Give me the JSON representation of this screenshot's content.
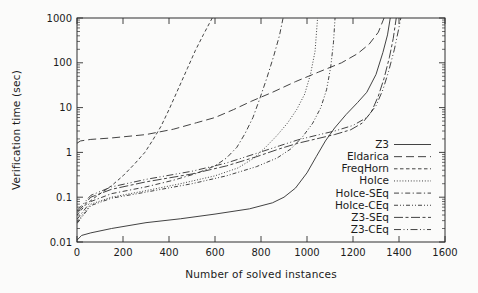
{
  "figure": {
    "background": "#fbfbfa",
    "line_color": "#2e2e2e",
    "text_color": "#1c1c1c"
  },
  "chart_data": {
    "type": "line",
    "title": "",
    "xlabel": "Number of solved instances",
    "ylabel": "Verification time (sec)",
    "x_axis": {
      "min": 0,
      "max": 1600,
      "ticks": [
        0,
        200,
        400,
        600,
        800,
        1000,
        1200,
        1400,
        1600
      ],
      "scale": "linear"
    },
    "y_axis": {
      "min": 0.01,
      "max": 1000,
      "ticks": [
        "0.01",
        "0.1",
        "1",
        "10",
        "100",
        "1000"
      ],
      "scale": "log",
      "minor_ticks": true
    },
    "grid": false,
    "legend_position": "inside-right",
    "series": [
      {
        "name": "Z3",
        "dash": "",
        "points": [
          [
            0,
            0.011
          ],
          [
            20,
            0.014
          ],
          [
            60,
            0.016
          ],
          [
            150,
            0.02
          ],
          [
            300,
            0.027
          ],
          [
            450,
            0.033
          ],
          [
            600,
            0.042
          ],
          [
            750,
            0.055
          ],
          [
            850,
            0.075
          ],
          [
            900,
            0.1
          ],
          [
            950,
            0.16
          ],
          [
            1000,
            0.35
          ],
          [
            1040,
            0.8
          ],
          [
            1080,
            1.8
          ],
          [
            1120,
            3.5
          ],
          [
            1170,
            7
          ],
          [
            1220,
            13
          ],
          [
            1260,
            22
          ],
          [
            1300,
            55
          ],
          [
            1330,
            170
          ],
          [
            1350,
            420
          ],
          [
            1362,
            1000
          ]
        ]
      },
      {
        "name": "Eldarica",
        "dash": "8,4",
        "points": [
          [
            0,
            1.6
          ],
          [
            15,
            1.8
          ],
          [
            60,
            1.95
          ],
          [
            150,
            2.1
          ],
          [
            300,
            2.5
          ],
          [
            420,
            3.3
          ],
          [
            520,
            4.6
          ],
          [
            600,
            6
          ],
          [
            680,
            9
          ],
          [
            760,
            14
          ],
          [
            850,
            22
          ],
          [
            950,
            38
          ],
          [
            1050,
            62
          ],
          [
            1150,
            100
          ],
          [
            1220,
            160
          ],
          [
            1270,
            260
          ],
          [
            1310,
            480
          ],
          [
            1335,
            1000
          ]
        ]
      },
      {
        "name": "FreqHorn",
        "dash": "3.5,2.5",
        "points": [
          [
            0,
            0.04
          ],
          [
            40,
            0.07
          ],
          [
            90,
            0.11
          ],
          [
            150,
            0.18
          ],
          [
            200,
            0.3
          ],
          [
            250,
            0.55
          ],
          [
            295,
            1
          ],
          [
            330,
            1.9
          ],
          [
            365,
            3.8
          ],
          [
            400,
            9
          ],
          [
            440,
            26
          ],
          [
            480,
            75
          ],
          [
            515,
            190
          ],
          [
            550,
            430
          ],
          [
            575,
            750
          ],
          [
            588,
            1000
          ]
        ]
      },
      {
        "name": "HoIce",
        "dash": "1,1.8",
        "points": [
          [
            0,
            0.028
          ],
          [
            60,
            0.07
          ],
          [
            150,
            0.1
          ],
          [
            300,
            0.14
          ],
          [
            450,
            0.2
          ],
          [
            600,
            0.3
          ],
          [
            700,
            0.45
          ],
          [
            770,
            0.75
          ],
          [
            820,
            1.3
          ],
          [
            870,
            2.4
          ],
          [
            915,
            4.5
          ],
          [
            955,
            9
          ],
          [
            990,
            20
          ],
          [
            1015,
            55
          ],
          [
            1035,
            180
          ],
          [
            1046,
            1000
          ]
        ]
      },
      {
        "name": "HoIce-SEq",
        "dash": "5,2.5,1.2,2.5",
        "points": [
          [
            0,
            0.032
          ],
          [
            60,
            0.08
          ],
          [
            150,
            0.12
          ],
          [
            300,
            0.17
          ],
          [
            420,
            0.24
          ],
          [
            520,
            0.34
          ],
          [
            600,
            0.5
          ],
          [
            650,
            0.75
          ],
          [
            695,
            1.3
          ],
          [
            730,
            2.6
          ],
          [
            765,
            6
          ],
          [
            795,
            16
          ],
          [
            825,
            45
          ],
          [
            855,
            140
          ],
          [
            880,
            400
          ],
          [
            896,
            1000
          ]
        ]
      },
      {
        "name": "HoIce-CEq",
        "dash": "4,2,1,2,1,2",
        "points": [
          [
            0,
            0.026
          ],
          [
            60,
            0.065
          ],
          [
            150,
            0.095
          ],
          [
            300,
            0.13
          ],
          [
            500,
            0.2
          ],
          [
            650,
            0.3
          ],
          [
            780,
            0.48
          ],
          [
            870,
            0.75
          ],
          [
            930,
            1.2
          ],
          [
            980,
            2.2
          ],
          [
            1025,
            4.5
          ],
          [
            1060,
            10
          ],
          [
            1085,
            25
          ],
          [
            1103,
            80
          ],
          [
            1115,
            280
          ],
          [
            1122,
            1000
          ]
        ]
      },
      {
        "name": "Z3-SEq",
        "dash": "9,2.5,3,2.5",
        "points": [
          [
            0,
            0.045
          ],
          [
            60,
            0.1
          ],
          [
            150,
            0.15
          ],
          [
            300,
            0.22
          ],
          [
            500,
            0.33
          ],
          [
            650,
            0.5
          ],
          [
            780,
            0.8
          ],
          [
            880,
            1.2
          ],
          [
            960,
            1.6
          ],
          [
            1040,
            2.0
          ],
          [
            1120,
            2.5
          ],
          [
            1190,
            3.2
          ],
          [
            1240,
            4.5
          ],
          [
            1280,
            8
          ],
          [
            1310,
            18
          ],
          [
            1335,
            45
          ],
          [
            1358,
            130
          ],
          [
            1375,
            350
          ],
          [
            1388,
            1000
          ]
        ]
      },
      {
        "name": "Z3-CEq",
        "dash": "7,2.5,1,2.5,1,2.5",
        "points": [
          [
            0,
            0.05
          ],
          [
            60,
            0.11
          ],
          [
            150,
            0.17
          ],
          [
            300,
            0.25
          ],
          [
            500,
            0.38
          ],
          [
            650,
            0.58
          ],
          [
            780,
            0.95
          ],
          [
            880,
            1.4
          ],
          [
            960,
            1.9
          ],
          [
            1040,
            2.4
          ],
          [
            1120,
            3
          ],
          [
            1200,
            4
          ],
          [
            1260,
            6
          ],
          [
            1300,
            11
          ],
          [
            1330,
            25
          ],
          [
            1355,
            65
          ],
          [
            1380,
            200
          ],
          [
            1398,
            550
          ],
          [
            1408,
            1000
          ]
        ]
      }
    ]
  }
}
